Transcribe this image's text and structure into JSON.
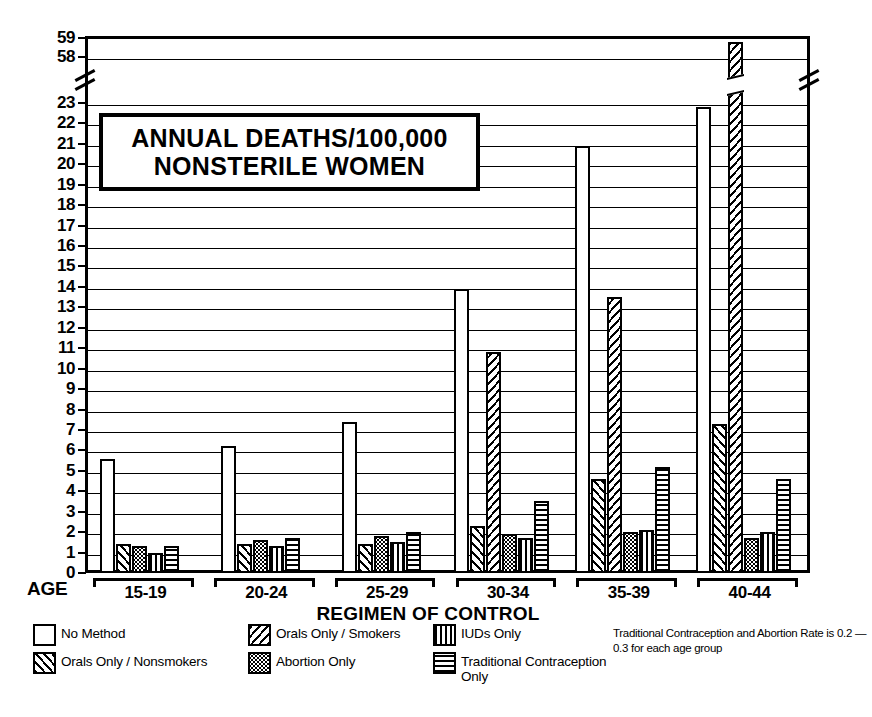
{
  "chart_data": {
    "type": "bar",
    "title": "ANNUAL DEATHS/100,000 NONSTERILE WOMEN",
    "title_lines": [
      "ANNUAL DEATHS/100,000",
      "NONSTERILE WOMEN"
    ],
    "xlabel": "REGIMEN OF CONTROL",
    "axis_group_label": "AGE",
    "ylabel": "",
    "categories": [
      "15-19",
      "20-24",
      "25-29",
      "30-34",
      "35-39",
      "40-44"
    ],
    "ylim": [
      0,
      59
    ],
    "yticks": [
      0,
      1,
      2,
      3,
      4,
      5,
      6,
      7,
      8,
      9,
      10,
      11,
      12,
      13,
      14,
      15,
      16,
      17,
      18,
      19,
      20,
      21,
      22,
      23,
      58,
      59
    ],
    "y_axis_break": {
      "between": [
        23,
        58
      ],
      "present": true
    },
    "grid": true,
    "legend_position": "below",
    "series": [
      {
        "name": "No Method",
        "pattern": "solid-white",
        "values": [
          5.6,
          6.2,
          7.4,
          13.9,
          20.9,
          22.8
        ]
      },
      {
        "name": "Orals Only / Nonsmokers",
        "pattern": "diagonal-up-hatch",
        "values": [
          1.4,
          1.4,
          1.4,
          2.3,
          4.6,
          7.3
        ]
      },
      {
        "name": "Orals Only / Smokers",
        "pattern": "diagonal-down-hatch",
        "values": [
          null,
          null,
          null,
          10.8,
          13.5,
          58.8
        ]
      },
      {
        "name": "Abortion Only",
        "pattern": "stipple-dots",
        "values": [
          1.3,
          1.6,
          1.8,
          1.9,
          2.0,
          1.7
        ]
      },
      {
        "name": "IUDs Only",
        "pattern": "vertical-lines",
        "values": [
          1.0,
          1.3,
          1.5,
          1.7,
          2.1,
          2.0
        ]
      },
      {
        "name": "Traditional Contraception Only",
        "pattern": "horizontal-lines",
        "values": [
          1.3,
          1.7,
          2.0,
          3.5,
          5.2,
          4.6
        ]
      }
    ],
    "annotations": [
      "Traditional Contraception and Abortion Rate is 0.2 — 0.3 for each age group"
    ]
  },
  "legend": {
    "items": [
      {
        "label": "No Method",
        "pattern": "solid-white"
      },
      {
        "label": "Orals Only / Nonsmokers",
        "pattern": "diagonal-up-hatch"
      },
      {
        "label": "Orals Only / Smokers",
        "pattern": "diagonal-down-hatch"
      },
      {
        "label": "Abortion Only",
        "pattern": "stipple-dots"
      },
      {
        "label": "IUDs Only",
        "pattern": "vertical-lines"
      },
      {
        "label": "Traditional Contraception\nOnly",
        "pattern": "horizontal-lines"
      }
    ],
    "note": "Traditional Contraception and Abortion Rate is 0.2 — 0.3 for each age group"
  },
  "colors": {
    "ink": "#000000",
    "paper": "#ffffff"
  }
}
